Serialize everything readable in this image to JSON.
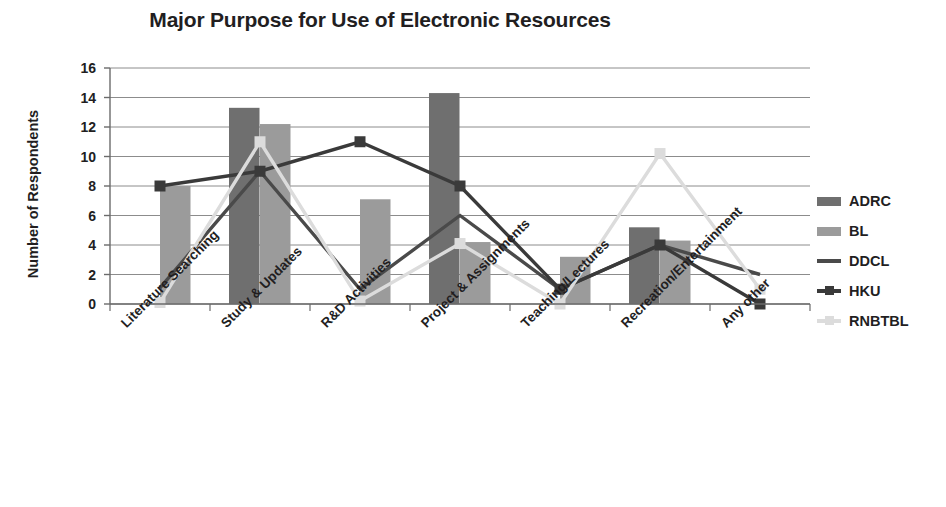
{
  "chart_data": {
    "type": "bar",
    "title": "Major Purpose for Use of Electronic Resources",
    "xlabel": "",
    "ylabel": "Number of Respondents",
    "ylim": [
      0,
      16
    ],
    "ytick_step": 2,
    "yticks": [
      "16",
      "14",
      "12",
      "10",
      "8",
      "6",
      "4",
      "2",
      "0"
    ],
    "grid": true,
    "legend_position": "right",
    "categories": [
      "Literature Searching",
      "Study & Updates",
      "R&D Activities",
      "Project & Assignments",
      "Teaching/Lectures",
      "Recreation/Entertainment",
      "Any other"
    ],
    "series": [
      {
        "name": "ADRC",
        "type": "bar",
        "color": "#6f6f6f",
        "values": [
          0,
          13.3,
          0,
          14.3,
          0,
          5.2,
          0
        ]
      },
      {
        "name": "BL",
        "type": "bar",
        "color": "#9b9b9b",
        "values": [
          8,
          12.2,
          7.1,
          4.2,
          3.2,
          4.3,
          0
        ]
      },
      {
        "name": "DDCL",
        "type": "line",
        "color": "#4a4a4a",
        "marker": "none",
        "values": [
          1.1,
          9,
          1,
          6,
          1,
          4,
          2
        ]
      },
      {
        "name": "HKU",
        "type": "line",
        "color": "#3a3a3a",
        "marker": "square",
        "values": [
          8,
          9,
          11,
          8,
          1,
          4,
          0
        ]
      },
      {
        "name": "RNBTBL",
        "type": "line",
        "color": "#dcdcdc",
        "marker": "square",
        "values": [
          0.1,
          11,
          0.2,
          4.1,
          0,
          10.2,
          1
        ]
      }
    ]
  },
  "legend": {
    "items": [
      {
        "label": "ADRC",
        "key": "bar",
        "color": "#6f6f6f"
      },
      {
        "label": "BL",
        "key": "bar",
        "color": "#9b9b9b"
      },
      {
        "label": "DDCL",
        "key": "line",
        "color": "#4a4a4a"
      },
      {
        "label": "HKU",
        "key": "line-marker",
        "color": "#3a3a3a"
      },
      {
        "label": "RNBTBL",
        "key": "line-marker",
        "color": "#dcdcdc"
      }
    ]
  },
  "colors": {
    "background": "#ffffff",
    "text": "#221e1f",
    "gridline": "#8c8c8c",
    "axis": "#6b6b6b"
  }
}
